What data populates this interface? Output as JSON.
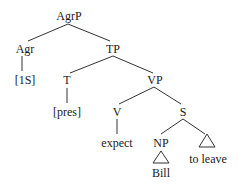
{
  "diagram": {
    "type": "syntax-tree",
    "nodes": {
      "agrp": "AgrP",
      "agr": "Agr",
      "tp": "TP",
      "agr_feature": "[1S]",
      "t": "T",
      "vp": "VP",
      "t_feature": "[pres]",
      "v": "V",
      "s": "S",
      "verb": "expect",
      "np": "NP",
      "subject": "Bill",
      "infinitive": "to leave"
    },
    "edges": [
      [
        "AgrP",
        "Agr"
      ],
      [
        "AgrP",
        "TP"
      ],
      [
        "Agr",
        "[1S]"
      ],
      [
        "TP",
        "T"
      ],
      [
        "TP",
        "VP"
      ],
      [
        "T",
        "[pres]"
      ],
      [
        "VP",
        "V"
      ],
      [
        "VP",
        "S"
      ],
      [
        "V",
        "expect"
      ],
      [
        "S",
        "NP"
      ],
      [
        "S",
        "to leave (triangle)"
      ],
      [
        "NP",
        "Bill (triangle)"
      ]
    ],
    "line_color": "#333333",
    "text_color": "#1a1a1a"
  }
}
